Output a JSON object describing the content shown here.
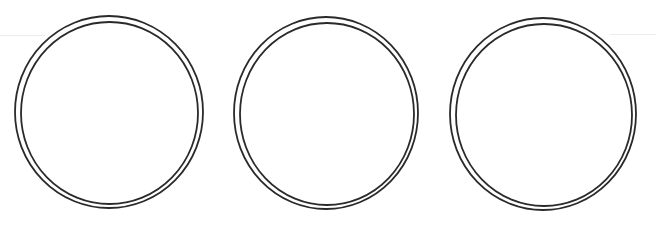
{
  "canvas": {
    "width": 656,
    "height": 231,
    "background": "#ffffff"
  },
  "style": {
    "stroke_color": "#2a2a2a",
    "stroke_width": 1.8,
    "artifact_color": "#ececec"
  },
  "rings": [
    {
      "name": "ring-1",
      "outer": {
        "cx": 109,
        "cy": 112,
        "rx": 94,
        "ry": 96
      },
      "inner": {
        "cx": 109.5,
        "cy": 113,
        "rx": 88.5,
        "ry": 91
      }
    },
    {
      "name": "ring-2",
      "outer": {
        "cx": 326,
        "cy": 113,
        "rx": 92,
        "ry": 96
      },
      "inner": {
        "cx": 327,
        "cy": 114,
        "rx": 87,
        "ry": 91
      }
    },
    {
      "name": "ring-3",
      "outer": {
        "cx": 543,
        "cy": 114,
        "rx": 93,
        "ry": 96
      },
      "inner": {
        "cx": 544,
        "cy": 115,
        "rx": 88,
        "ry": 91
      }
    }
  ],
  "artifacts": [
    {
      "x": 0,
      "y": 35,
      "width": 45
    },
    {
      "x": 610,
      "y": 34,
      "width": 46
    }
  ]
}
